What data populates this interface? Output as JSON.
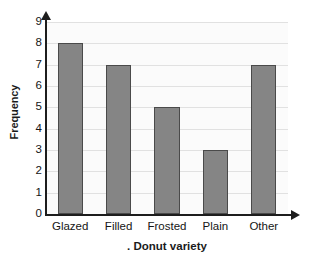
{
  "chart_data": {
    "type": "bar",
    "title": "",
    "categories": [
      "Glazed",
      "Filled",
      "Frosted",
      "Plain",
      "Other"
    ],
    "values": [
      8,
      7,
      5,
      3,
      7
    ],
    "xlabel": ". Donut variety",
    "ylabel": "Frequency",
    "ylim": [
      0,
      9
    ],
    "ytick_labels": [
      "0",
      "1",
      "2",
      "3",
      "4",
      "5",
      "6",
      "7",
      "8",
      "9"
    ],
    "ytick_values": [
      0,
      1,
      2,
      3,
      4,
      5,
      6,
      7,
      8,
      9
    ],
    "grid": true,
    "grid_orientation": "horizontal",
    "legend": false,
    "legend_position": "none",
    "bar_color": "#858585",
    "bar_border_color": "#4a4a4a",
    "axis_color": "#1d1d1d",
    "gridline_color": "#e1e1e1",
    "plot_background": "#fbfbfb",
    "page_background": "#ffffff",
    "text_color": "#151515",
    "y_axis_has_arrow": true,
    "x_axis_has_arrow": true
  }
}
